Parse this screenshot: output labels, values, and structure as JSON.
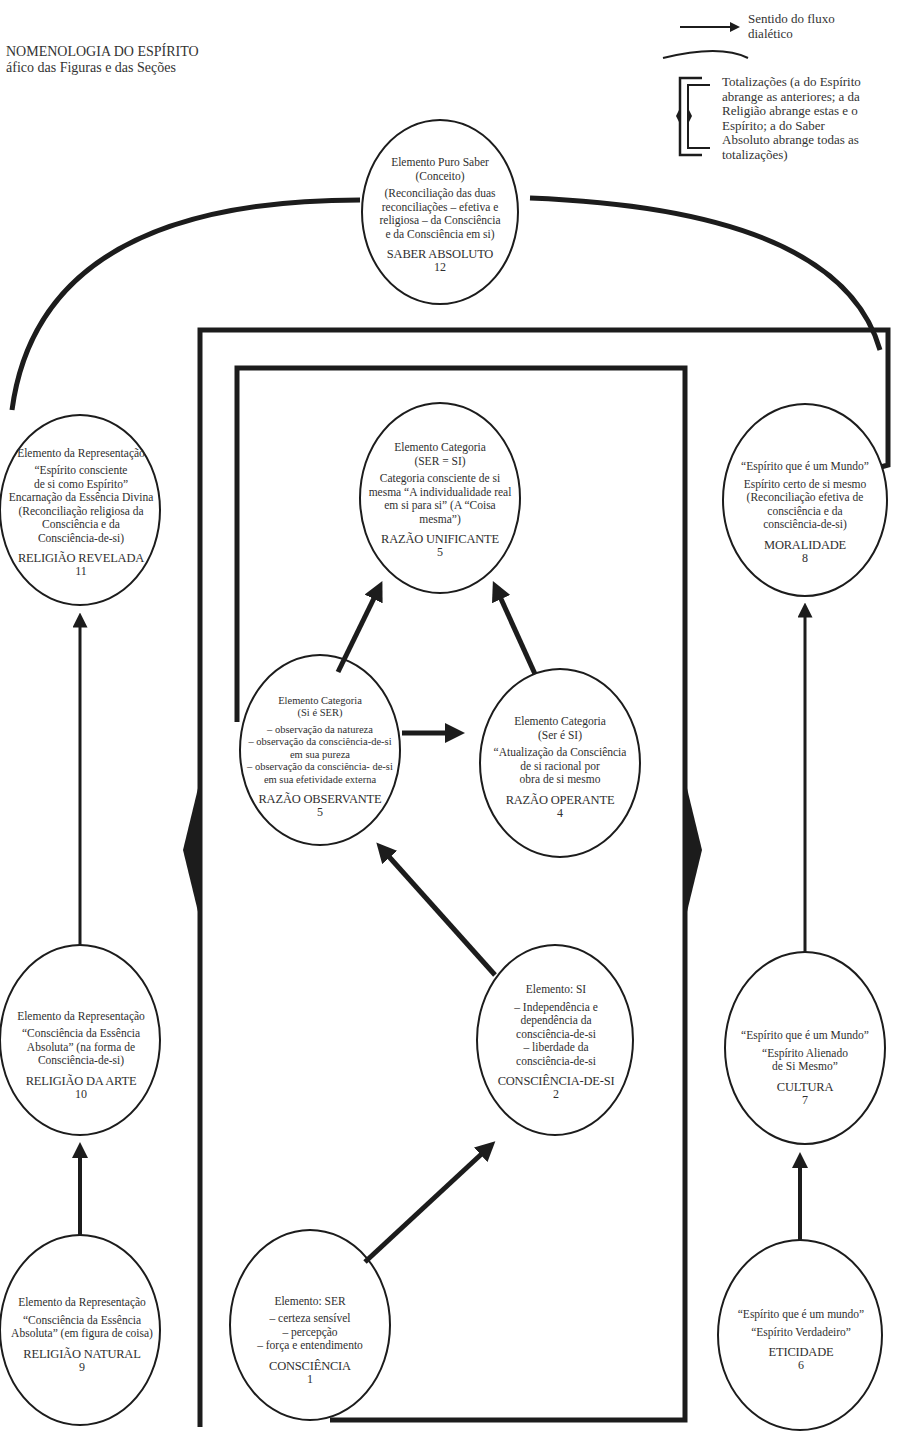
{
  "title": {
    "line1": "NOMENOLOGIA DO ESPÍRITO",
    "line2": "áfico das Figuras e das Seções"
  },
  "legend": {
    "arrow_label_1": "Sentido do fluxo",
    "arrow_label_2": "dialético",
    "bracket_label": [
      "Totalizações (a do Espírito",
      "abrange as anteriores; a da",
      "Religião abrange estas e o",
      "Espírito; a do Saber",
      "Absoluto abrange todas as",
      "totalizações)"
    ]
  },
  "nodes": {
    "saber_absoluto": {
      "lines": [
        "Elemento Puro Saber\n(Conceito)",
        "(Reconciliação das duas\nreconciliações – efetiva e\nreligiosa – da Consciência\ne da Consciência em si)"
      ],
      "name": "SABER ABSOLUTO",
      "number": "12"
    },
    "religiao_revelada": {
      "lines": [
        "Elemento da Representação",
        "“Espírito consciente\nde si como Espírito”\nEncarnação da Essência Divina\n(Reconciliação religiosa da\nConsciência e da\nConsciência-de-si)"
      ],
      "name": "RELIGIÃO REVELADA",
      "number": "11"
    },
    "razao_unificante": {
      "lines": [
        "Elemento Categoria\n(SER = SI)",
        "Categoria consciente de si\nmesma “A individualidade real\nem si para si” (A “Coisa\nmesma”)"
      ],
      "name": "RAZÃO UNIFICANTE",
      "number": "5"
    },
    "moralidade": {
      "lines": [
        "“Espírito que é um Mundo”",
        "Espírito certo de si mesmo\n(Reconciliação efetiva de\nconsciência e da\nconsciência-de-si)"
      ],
      "name": "MORALIDADE",
      "number": "8"
    },
    "razao_observante": {
      "lines": [
        "Elemento Categoria\n(Si é SER)",
        "– observação da natureza\n– observação da consciência-de-si\nem sua pureza\n– observação da consciência- de-si\nem sua efetividade externa"
      ],
      "name": "RAZÃO OBSERVANTE",
      "number": "5"
    },
    "razao_operante": {
      "lines": [
        "Elemento Categoria\n(Ser é SI)",
        "“Atualização da Consciência\nde si racional por\nobra de si mesmo"
      ],
      "name": "RAZÃO OPERANTE",
      "number": "4"
    },
    "religiao_da_arte": {
      "lines": [
        "Elemento da Representação",
        "“Consciência da Essência\nAbsoluta” (na forma de\nConsciência-de-si)"
      ],
      "name": "RELIGIÃO DA ARTE",
      "number": "10"
    },
    "consciencia_de_si": {
      "lines": [
        "Elemento: SI",
        "– Independência e\ndependência da\nconsciência-de-si\n– liberdade da\nconsciência-de-si"
      ],
      "name": "CONSCIÊNCIA-DE-SI",
      "number": "2"
    },
    "cultura": {
      "lines": [
        "“Espírito que é um Mundo”",
        "“Espírito Alienado\nde Si Mesmo”"
      ],
      "name": "CULTURA",
      "number": "7"
    },
    "religiao_natural": {
      "lines": [
        "Elemento da Representação",
        "“Consciência da Essência\nAbsoluta” (em figura de coisa)"
      ],
      "name": "RELIGIÃO NATURAL",
      "number": "9"
    },
    "consciencia": {
      "lines": [
        "Elemento: SER",
        "– certeza sensível\n– percepção\n– força e entendimento"
      ],
      "name": "CONSCIÊNCIA",
      "number": "1"
    },
    "eticidade": {
      "lines": [
        "“Espírito que é um mundo”",
        "“Espírito Verdadeiro”"
      ],
      "name": "ETICIDADE",
      "number": "6"
    }
  },
  "colors": {
    "ink": "#1c1c1c",
    "text": "#2f2f2f",
    "background": "#ffffff"
  }
}
